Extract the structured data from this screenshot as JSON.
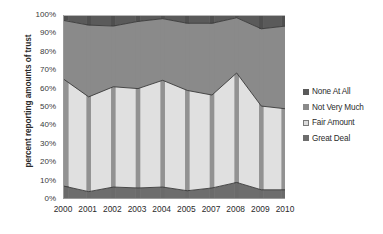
{
  "chart_data": {
    "type": "area",
    "stacked": true,
    "title": "",
    "subtitle": "",
    "xlabel": "",
    "ylabel": "percent reporting amounts of trust",
    "categories": [
      "2000",
      "2001",
      "2002",
      "2003",
      "2004",
      "2005",
      "2007",
      "2008",
      "2009",
      "2010"
    ],
    "ylim": [
      0,
      100
    ],
    "ytick_labels": [
      "0%",
      "10%",
      "20%",
      "30%",
      "40%",
      "50%",
      "60%",
      "70%",
      "80%",
      "90%",
      "100%"
    ],
    "ytick_values": [
      0,
      10,
      20,
      30,
      40,
      50,
      60,
      70,
      80,
      90,
      100
    ],
    "grid": true,
    "legend_position": "right",
    "series": [
      {
        "name": "Great Deal",
        "color": "#6d6d6d",
        "values": [
          7,
          4,
          6.5,
          6,
          6.5,
          4.5,
          6,
          9,
          5,
          5
        ]
      },
      {
        "name": "Fair Amount",
        "color": "#e0e0e0",
        "values": [
          58,
          51.5,
          54.5,
          54,
          58,
          54.5,
          50.5,
          59.5,
          45.5,
          44
        ]
      },
      {
        "name": "Not Very Much",
        "color": "#8a8a8a",
        "values": [
          32,
          39,
          33,
          36.5,
          33.5,
          36.5,
          39,
          30,
          42,
          45
        ]
      },
      {
        "name": "None At All",
        "color": "#5a5a5a",
        "values": [
          3,
          5.5,
          6,
          3.5,
          2,
          4.5,
          4.5,
          1.5,
          7.5,
          6
        ]
      }
    ],
    "cumulative_boundaries": {
      "great_deal_top": [
        7,
        4,
        6.5,
        6,
        6.5,
        4.5,
        6,
        9,
        5,
        5
      ],
      "fair_amount_top": [
        65,
        55.5,
        61,
        60,
        64.5,
        59,
        56.5,
        68.5,
        50.5,
        49
      ],
      "not_very_much_top": [
        97,
        94.5,
        94,
        96.5,
        98,
        95.5,
        95.5,
        98.5,
        92.5,
        94
      ]
    }
  },
  "legend": {
    "items": [
      {
        "label": "None At All",
        "color": "#5a5a5a"
      },
      {
        "label": "Not Very Much",
        "color": "#8a8a8a"
      },
      {
        "label": "Fair Amount",
        "color": "#dcdcdc"
      },
      {
        "label": "Great Deal",
        "color": "#6d6d6d"
      }
    ]
  }
}
